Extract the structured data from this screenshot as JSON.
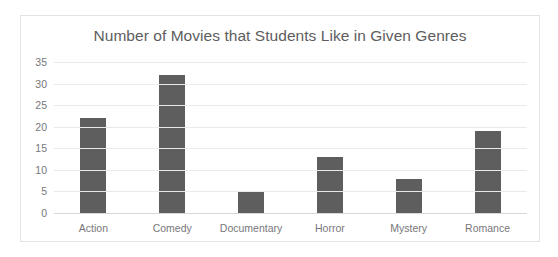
{
  "clipped_header_text": "",
  "chart_data": {
    "type": "bar",
    "title": "Number of Movies that Students Like in Given Genres",
    "xlabel": "",
    "ylabel": "",
    "categories": [
      "Action",
      "Comedy",
      "Documentary",
      "Horror",
      "Mystery",
      "Romance"
    ],
    "values": [
      22,
      32,
      5,
      13,
      8,
      19
    ],
    "ylim": [
      0,
      35
    ],
    "ytick_step": 5,
    "yticks": [
      35,
      30,
      25,
      20,
      15,
      10,
      5,
      0
    ],
    "grid": "horizontal",
    "legend": "none",
    "colors": {
      "bar": "#5e5e5e",
      "gridline": "#e9e9e9",
      "axis_text": "#77777a",
      "title_text": "#5d5d5d",
      "frame_border": "#e3e3e5",
      "plot_background": "#ffffff"
    }
  }
}
